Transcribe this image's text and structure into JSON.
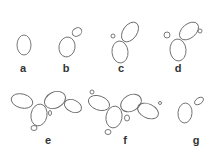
{
  "figure": {
    "stroke_color": "#6a6a6a",
    "label_color": "#333333",
    "panels": [
      {
        "label": "a",
        "label_pos": [
          23,
          72
        ],
        "cells": [
          {
            "cx": 24,
            "cy": 45,
            "rx": 7,
            "ry": 10,
            "rot": 0
          }
        ]
      },
      {
        "label": "b",
        "label_pos": [
          66,
          72
        ],
        "cells": [
          {
            "cx": 67,
            "cy": 47,
            "rx": 8,
            "ry": 10,
            "rot": 10
          },
          {
            "cx": 77,
            "cy": 32,
            "rx": 5,
            "ry": 4,
            "rot": -30
          }
        ]
      },
      {
        "label": "c",
        "label_pos": [
          121,
          72
        ],
        "cells": [
          {
            "cx": 120,
            "cy": 52,
            "rx": 8,
            "ry": 11,
            "rot": -5
          },
          {
            "cx": 130,
            "cy": 32,
            "rx": 7,
            "ry": 11,
            "rot": 35
          },
          {
            "cx": 113,
            "cy": 36,
            "rx": 2,
            "ry": 2,
            "rot": 0
          }
        ]
      },
      {
        "label": "d",
        "label_pos": [
          178,
          72
        ],
        "cells": [
          {
            "cx": 178,
            "cy": 50,
            "rx": 8,
            "ry": 11,
            "rot": -5
          },
          {
            "cx": 189,
            "cy": 31,
            "rx": 7,
            "ry": 11,
            "rot": 50
          },
          {
            "cx": 167,
            "cy": 35,
            "rx": 3,
            "ry": 3,
            "rot": 0
          },
          {
            "cx": 200,
            "cy": 31,
            "rx": 2,
            "ry": 2,
            "rot": 0
          }
        ]
      },
      {
        "label": "e",
        "label_pos": [
          48,
          144
        ],
        "cells": [
          {
            "cx": 22,
            "cy": 101,
            "rx": 11,
            "ry": 7,
            "rot": 15
          },
          {
            "cx": 39,
            "cy": 115,
            "rx": 8,
            "ry": 11,
            "rot": 10
          },
          {
            "cx": 55,
            "cy": 100,
            "rx": 11,
            "ry": 8,
            "rot": -25
          },
          {
            "cx": 73,
            "cy": 106,
            "rx": 9,
            "ry": 6,
            "rot": 25
          },
          {
            "cx": 34,
            "cy": 128,
            "rx": 3,
            "ry": 2.5,
            "rot": 0
          },
          {
            "cx": 50,
            "cy": 113,
            "rx": 1.5,
            "ry": 2.5,
            "rot": 0
          }
        ]
      },
      {
        "label": "f",
        "label_pos": [
          125,
          144
        ],
        "cells": [
          {
            "cx": 99,
            "cy": 103,
            "rx": 11,
            "ry": 7,
            "rot": 20
          },
          {
            "cx": 114,
            "cy": 117,
            "rx": 8,
            "ry": 11,
            "rot": 10
          },
          {
            "cx": 131,
            "cy": 103,
            "rx": 11,
            "ry": 8,
            "rot": -30
          },
          {
            "cx": 148,
            "cy": 111,
            "rx": 11,
            "ry": 7,
            "rot": 25
          },
          {
            "cx": 92,
            "cy": 92,
            "rx": 2,
            "ry": 2,
            "rot": 0
          },
          {
            "cx": 108,
            "cy": 132,
            "rx": 3,
            "ry": 2.5,
            "rot": 0
          },
          {
            "cx": 127,
            "cy": 118,
            "rx": 2.5,
            "ry": 3,
            "rot": 0
          },
          {
            "cx": 160,
            "cy": 103,
            "rx": 1.5,
            "ry": 1.5,
            "rot": 0
          }
        ]
      },
      {
        "label": "g",
        "label_pos": [
          196,
          144
        ],
        "cells": [
          {
            "cx": 185,
            "cy": 113,
            "rx": 7,
            "ry": 10,
            "rot": 5
          },
          {
            "cx": 199,
            "cy": 101,
            "rx": 5,
            "ry": 3,
            "rot": -35
          }
        ]
      }
    ]
  }
}
